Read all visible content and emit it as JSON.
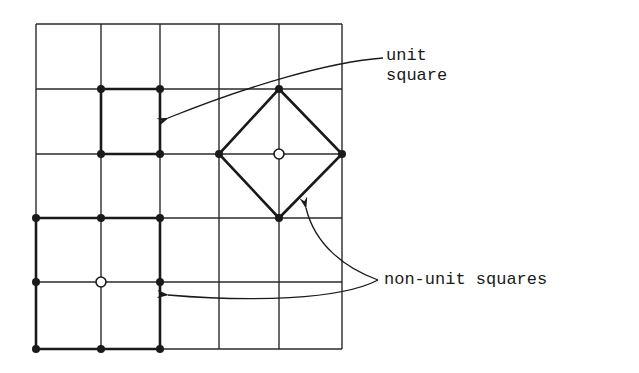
{
  "figure": {
    "type": "grid diagram",
    "grid": {
      "cols": 5,
      "rows": 5,
      "x_lines": [
        36,
        101,
        160,
        219,
        279,
        342
      ],
      "y_lines": [
        24,
        89,
        154,
        218,
        282,
        349
      ],
      "line_color": "#2a2a2a"
    },
    "labels": {
      "unit_square_line1": "unit",
      "unit_square_line2": "square",
      "non_unit_squares": "non-unit squares"
    },
    "shapes": {
      "unit_square": {
        "corners": [
          [
            101,
            89
          ],
          [
            160,
            89
          ],
          [
            160,
            154
          ],
          [
            101,
            154
          ]
        ]
      },
      "diamond_square": {
        "corners": [
          [
            279,
            89
          ],
          [
            342,
            154
          ],
          [
            279,
            218
          ],
          [
            219,
            154
          ]
        ],
        "center": [
          279,
          154
        ]
      },
      "big_square": {
        "corners": [
          [
            36,
            218
          ],
          [
            160,
            218
          ],
          [
            160,
            349
          ],
          [
            36,
            349
          ]
        ],
        "center": [
          101,
          282
        ]
      }
    },
    "filled_dots": [
      [
        101,
        89
      ],
      [
        160,
        89
      ],
      [
        101,
        154
      ],
      [
        160,
        154
      ],
      [
        279,
        89
      ],
      [
        219,
        154
      ],
      [
        342,
        154
      ],
      [
        279,
        218
      ],
      [
        36,
        218
      ],
      [
        101,
        218
      ],
      [
        160,
        218
      ],
      [
        36,
        282
      ],
      [
        160,
        282
      ],
      [
        36,
        349
      ],
      [
        101,
        349
      ],
      [
        160,
        349
      ]
    ],
    "open_dots": [
      [
        279,
        154
      ],
      [
        101,
        282
      ]
    ],
    "colors": {
      "ink": "#1a1a1a",
      "background": "#ffffff"
    }
  }
}
